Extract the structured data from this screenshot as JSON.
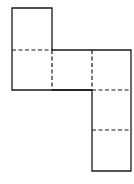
{
  "diagram": {
    "type": "cube-net",
    "line_color": "#1a1a1a",
    "background": "#ffffff",
    "grid": {
      "origin_x": 12,
      "origin_y": 8,
      "cell": 40
    },
    "faces": [
      {
        "col": 0,
        "row": 0
      },
      {
        "col": 0,
        "row": 1
      },
      {
        "col": 1,
        "row": 1
      },
      {
        "col": 2,
        "row": 1
      },
      {
        "col": 2,
        "row": 2
      },
      {
        "col": 2,
        "row": 3
      }
    ],
    "outline": "M12 8 L52 8 L52 50 L131 50 L131 171 L92 171 L92 90 L12 90 Z",
    "fold_lines": [
      {
        "x1": 12,
        "y1": 50,
        "x2": 52,
        "y2": 50
      },
      {
        "x1": 52,
        "y1": 50,
        "x2": 52,
        "y2": 90
      },
      {
        "x1": 92,
        "y1": 50,
        "x2": 92,
        "y2": 90
      },
      {
        "x1": 92,
        "y1": 90,
        "x2": 131,
        "y2": 90
      },
      {
        "x1": 92,
        "y1": 130,
        "x2": 131,
        "y2": 130
      }
    ],
    "solid_inner_lines": [
      {
        "x1": 52,
        "y1": 90,
        "x2": 92,
        "y2": 90
      }
    ]
  }
}
